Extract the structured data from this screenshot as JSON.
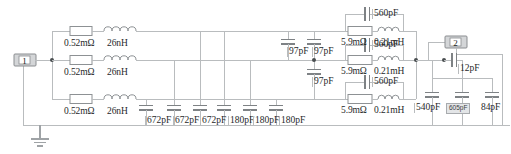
{
  "diagram": {
    "type": "electrical-schematic",
    "background_color": "#ffffff",
    "wire_color": "#b9bcbe",
    "label_color": "#26282a",
    "port_fill_color": "#d4d6d8",
    "selection_fill_color": "#e3e5e7"
  },
  "ports": {
    "input": {
      "label": "1",
      "name": "port-1"
    },
    "output": {
      "label": "2",
      "name": "port-2"
    }
  },
  "ground": {
    "name": "ground-symbol",
    "label": ""
  },
  "series_branches": [
    {
      "resistance": "0.52mΩ",
      "inductance": "26nH"
    },
    {
      "resistance": "0.52mΩ",
      "inductance": "26nH"
    },
    {
      "resistance": "0.52mΩ",
      "inductance": "26nH"
    }
  ],
  "shunt_capacitors_bottom": [
    {
      "value": "672pF"
    },
    {
      "value": "672pF"
    },
    {
      "value": "672pF"
    },
    {
      "value": "180pF"
    },
    {
      "value": "180pF"
    },
    {
      "value": "180pF"
    }
  ],
  "coupling_capacitors_97": [
    {
      "value": "97pF"
    },
    {
      "value": "97pF"
    },
    {
      "value": "97pF"
    }
  ],
  "rl_parallel_branches": [
    {
      "resistance": "5.9mΩ",
      "inductance": "0.21mH",
      "capacitance": "560pF"
    },
    {
      "resistance": "5.9mΩ",
      "inductance": "0.21mH",
      "capacitance": "560pF"
    },
    {
      "resistance": "5.9mΩ",
      "inductance": "0.21mH",
      "capacitance": "560pF"
    }
  ],
  "output_capacitors": [
    {
      "value": "12pF",
      "selected": false
    },
    {
      "value": "540pF",
      "selected": false
    },
    {
      "value": "605pF",
      "selected": true
    },
    {
      "value": "84pF",
      "selected": false
    }
  ]
}
